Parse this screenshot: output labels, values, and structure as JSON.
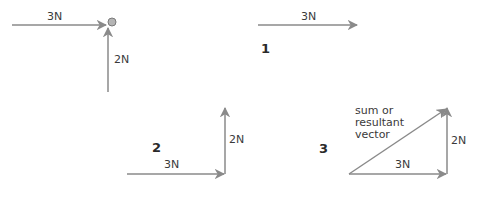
{
  "colors": {
    "arrow": "#8a8a8a",
    "text": "#3a3a3a",
    "number": "#2a2a2a",
    "object_fill": "#b5b5b5"
  },
  "diagrams": [
    {
      "id": "forces-on-object",
      "number": "",
      "horizontal_label": "3N",
      "vertical_label": "2N"
    },
    {
      "id": "step-1",
      "number": "1",
      "horizontal_label": "3N"
    },
    {
      "id": "step-2",
      "number": "2",
      "horizontal_label": "3N",
      "vertical_label": "2N"
    },
    {
      "id": "step-3",
      "number": "3",
      "horizontal_label": "3N",
      "vertical_label": "2N",
      "resultant_label_lines": [
        "sum or",
        "resultant",
        "vector"
      ]
    }
  ]
}
